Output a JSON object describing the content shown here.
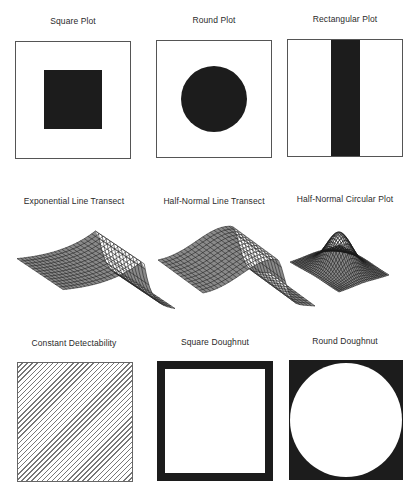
{
  "figure": {
    "panels": [
      {
        "id": "square-plot",
        "title": "Square Plot",
        "kind": "square-region"
      },
      {
        "id": "round-plot",
        "title": "Round Plot",
        "kind": "circle-region"
      },
      {
        "id": "rectangular-plot",
        "title": "Rectangular Plot",
        "kind": "strip-region"
      },
      {
        "id": "exponential-line-transect",
        "title": "Exponential Line Transect",
        "kind": "surface"
      },
      {
        "id": "half-normal-line-transect",
        "title": "Half-Normal Line Transect",
        "kind": "surface"
      },
      {
        "id": "half-normal-circular-plot",
        "title": "Half-Normal Circular Plot",
        "kind": "surface"
      },
      {
        "id": "constant-detectability",
        "title": "Constant Detectability",
        "kind": "hatched-region"
      },
      {
        "id": "square-doughnut",
        "title": "Square Doughnut",
        "kind": "square-ring"
      },
      {
        "id": "round-doughnut",
        "title": "Round Doughnut",
        "kind": "circle-ring"
      }
    ],
    "colors": {
      "fill": "#1c1c1c",
      "border": "#555555",
      "background": "#ffffff",
      "hatch": "#777777"
    }
  }
}
